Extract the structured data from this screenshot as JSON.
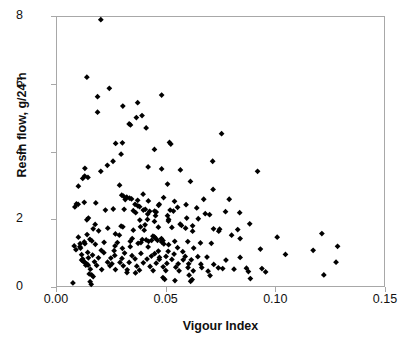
{
  "chart_data": {
    "type": "scatter",
    "title": "",
    "xlabel": "Vigour Index",
    "ylabel": "Resin flow, g/24 h",
    "xlim": [
      0.0,
      0.15
    ],
    "ylim": [
      0,
      8
    ],
    "xticks": [
      0.0,
      0.05,
      0.1,
      0.15
    ],
    "xtick_labels": [
      "0.00",
      "0.05",
      "0.10",
      "0.15"
    ],
    "yticks": [
      0,
      2,
      4,
      6,
      8
    ],
    "ytick_labels": [
      "0",
      "2",
      "4",
      "6",
      "8"
    ],
    "grid": false,
    "legend": false,
    "marker": "diamond",
    "marker_color": "#000000",
    "frame_color": "#a8a8a8",
    "series": [
      {
        "name": "Resin flow vs Vigour Index",
        "points": [
          [
            0.0201,
            7.92
          ],
          [
            0.0137,
            6.21
          ],
          [
            0.024,
            5.88
          ],
          [
            0.0186,
            5.63
          ],
          [
            0.048,
            5.68
          ],
          [
            0.037,
            5.45
          ],
          [
            0.0302,
            5.35
          ],
          [
            0.0186,
            5.17
          ],
          [
            0.039,
            5.07
          ],
          [
            0.0364,
            5.01
          ],
          [
            0.0331,
            4.82
          ],
          [
            0.0337,
            4.79
          ],
          [
            0.0409,
            4.7
          ],
          [
            0.0755,
            4.53
          ],
          [
            0.0516,
            4.27
          ],
          [
            0.03,
            4.26
          ],
          [
            0.0269,
            4.24
          ],
          [
            0.0522,
            4.22
          ],
          [
            0.0447,
            4.06
          ],
          [
            0.0294,
            3.92
          ],
          [
            0.0714,
            3.71
          ],
          [
            0.0257,
            3.71
          ],
          [
            0.0231,
            3.59
          ],
          [
            0.0418,
            3.54
          ],
          [
            0.0128,
            3.5
          ],
          [
            0.048,
            3.48
          ],
          [
            0.0566,
            3.45
          ],
          [
            0.092,
            3.41
          ],
          [
            0.0201,
            3.41
          ],
          [
            0.0127,
            3.27
          ],
          [
            0.0142,
            3.23
          ],
          [
            0.0118,
            3.2
          ],
          [
            0.0612,
            3.11
          ],
          [
            0.0507,
            3.03
          ],
          [
            0.0287,
            3.0
          ],
          [
            0.0098,
            2.97
          ],
          [
            0.0716,
            2.87
          ],
          [
            0.0395,
            2.73
          ],
          [
            0.0297,
            2.7
          ],
          [
            0.0305,
            2.67
          ],
          [
            0.032,
            2.64
          ],
          [
            0.0489,
            2.63
          ],
          [
            0.0673,
            2.58
          ],
          [
            0.079,
            2.58
          ],
          [
            0.0313,
            2.57
          ],
          [
            0.037,
            2.55
          ],
          [
            0.0419,
            2.53
          ],
          [
            0.0539,
            2.52
          ],
          [
            0.0125,
            2.49
          ],
          [
            0.0178,
            2.47
          ],
          [
            0.0089,
            2.44
          ],
          [
            0.0097,
            2.43
          ],
          [
            0.0358,
            2.43
          ],
          [
            0.0469,
            2.43
          ],
          [
            0.0592,
            2.42
          ],
          [
            0.0466,
            2.4
          ],
          [
            0.0371,
            2.38
          ],
          [
            0.0379,
            2.36
          ],
          [
            0.0553,
            2.34
          ],
          [
            0.0082,
            2.35
          ],
          [
            0.0641,
            2.32
          ],
          [
            0.0308,
            2.28
          ],
          [
            0.0405,
            2.28
          ],
          [
            0.0519,
            2.26
          ],
          [
            0.0222,
            2.26
          ],
          [
            0.035,
            2.24
          ],
          [
            0.0448,
            2.23
          ],
          [
            0.0534,
            2.23
          ],
          [
            0.0773,
            2.21
          ],
          [
            0.0838,
            2.18
          ],
          [
            0.0361,
            2.18
          ],
          [
            0.068,
            2.15
          ],
          [
            0.0416,
            2.14
          ],
          [
            0.0507,
            2.09
          ],
          [
            0.0144,
            2.02
          ],
          [
            0.0595,
            2.02
          ],
          [
            0.0648,
            2.0
          ],
          [
            0.0137,
            1.97
          ],
          [
            0.0415,
            1.98
          ],
          [
            0.038,
            1.96
          ],
          [
            0.0511,
            1.93
          ],
          [
            0.0447,
            1.92
          ],
          [
            0.0884,
            1.85
          ],
          [
            0.0565,
            1.84
          ],
          [
            0.0175,
            1.83
          ],
          [
            0.0404,
            1.82
          ],
          [
            0.0571,
            1.8
          ],
          [
            0.0622,
            1.79
          ],
          [
            0.0294,
            1.78
          ],
          [
            0.0302,
            1.76
          ],
          [
            0.0383,
            1.76
          ],
          [
            0.0465,
            1.75
          ],
          [
            0.0527,
            1.74
          ],
          [
            0.0233,
            1.72
          ],
          [
            0.059,
            1.72
          ],
          [
            0.0166,
            1.7
          ],
          [
            0.0718,
            1.7
          ],
          [
            0.0746,
            1.69
          ],
          [
            0.0829,
            1.68
          ],
          [
            0.035,
            1.66
          ],
          [
            0.04,
            1.66
          ],
          [
            0.0191,
            1.64
          ],
          [
            0.0622,
            1.63
          ],
          [
            0.1215,
            1.56
          ],
          [
            0.0138,
            1.53
          ],
          [
            0.0801,
            1.51
          ],
          [
            0.0286,
            1.51
          ],
          [
            0.044,
            1.48
          ],
          [
            0.0447,
            1.46
          ],
          [
            0.0098,
            1.45
          ],
          [
            0.101,
            1.45
          ],
          [
            0.0452,
            1.42
          ],
          [
            0.0479,
            1.41
          ],
          [
            0.0151,
            1.39
          ],
          [
            0.0391,
            1.38
          ],
          [
            0.0409,
            1.37
          ],
          [
            0.0434,
            1.36
          ],
          [
            0.0461,
            1.36
          ],
          [
            0.0486,
            1.35
          ],
          [
            0.016,
            1.34
          ],
          [
            0.0336,
            1.33
          ],
          [
            0.054,
            1.33
          ],
          [
            0.06,
            1.32
          ],
          [
            0.0125,
            1.31
          ],
          [
            0.0277,
            1.29
          ],
          [
            0.0658,
            1.28
          ],
          [
            0.0372,
            1.27
          ],
          [
            0.0708,
            1.27
          ],
          [
            0.0128,
            1.26
          ],
          [
            0.049,
            1.25
          ],
          [
            0.0176,
            1.24
          ],
          [
            0.0512,
            1.23
          ],
          [
            0.1287,
            1.18
          ],
          [
            0.0079,
            1.19
          ],
          [
            0.0336,
            1.17
          ],
          [
            0.0418,
            1.16
          ],
          [
            0.0553,
            1.14
          ],
          [
            0.0627,
            1.13
          ],
          [
            0.0933,
            1.1
          ],
          [
            0.1175,
            1.06
          ],
          [
            0.0087,
            1.08
          ],
          [
            0.0203,
            1.06
          ],
          [
            0.0262,
            1.05
          ],
          [
            0.0465,
            1.04
          ],
          [
            0.051,
            1.03
          ],
          [
            0.0577,
            1.02
          ],
          [
            0.0141,
            1.0
          ],
          [
            0.0215,
            0.99
          ],
          [
            0.031,
            0.98
          ],
          [
            0.0385,
            0.97
          ],
          [
            0.0448,
            0.96
          ],
          [
            0.0537,
            0.95
          ],
          [
            0.1048,
            0.94
          ],
          [
            0.0113,
            0.93
          ],
          [
            0.0163,
            0.92
          ],
          [
            0.0265,
            0.91
          ],
          [
            0.0344,
            0.9
          ],
          [
            0.0433,
            0.89
          ],
          [
            0.05,
            0.88
          ],
          [
            0.0588,
            0.88
          ],
          [
            0.0646,
            0.87
          ],
          [
            0.0688,
            0.86
          ],
          [
            0.084,
            0.85
          ],
          [
            0.0144,
            0.84
          ],
          [
            0.019,
            0.84
          ],
          [
            0.0247,
            0.83
          ],
          [
            0.0298,
            0.82
          ],
          [
            0.0358,
            0.81
          ],
          [
            0.0413,
            0.8
          ],
          [
            0.0469,
            0.79
          ],
          [
            0.0527,
            0.79
          ],
          [
            0.0579,
            0.78
          ],
          [
            0.0616,
            0.78
          ],
          [
            0.0775,
            0.77
          ],
          [
            0.128,
            0.71
          ],
          [
            0.0121,
            0.73
          ],
          [
            0.0172,
            0.72
          ],
          [
            0.0232,
            0.71
          ],
          [
            0.0289,
            0.7
          ],
          [
            0.0331,
            0.7
          ],
          [
            0.0396,
            0.69
          ],
          [
            0.0455,
            0.68
          ],
          [
            0.0504,
            0.67
          ],
          [
            0.0556,
            0.66
          ],
          [
            0.0604,
            0.66
          ],
          [
            0.066,
            0.65
          ],
          [
            0.0719,
            0.64
          ],
          [
            0.0132,
            0.62
          ],
          [
            0.0182,
            0.61
          ],
          [
            0.0243,
            0.6
          ],
          [
            0.0304,
            0.6
          ],
          [
            0.0366,
            0.59
          ],
          [
            0.0427,
            0.58
          ],
          [
            0.0487,
            0.57
          ],
          [
            0.0545,
            0.56
          ],
          [
            0.0601,
            0.55
          ],
          [
            0.0664,
            0.55
          ],
          [
            0.074,
            0.54
          ],
          [
            0.0869,
            0.53
          ],
          [
            0.094,
            0.52
          ],
          [
            0.0153,
            0.5
          ],
          [
            0.0205,
            0.49
          ],
          [
            0.0268,
            0.49
          ],
          [
            0.0322,
            0.48
          ],
          [
            0.0378,
            0.47
          ],
          [
            0.0441,
            0.46
          ],
          [
            0.0499,
            0.46
          ],
          [
            0.056,
            0.45
          ],
          [
            0.0625,
            0.45
          ],
          [
            0.0693,
            0.44
          ],
          [
            0.0878,
            0.43
          ],
          [
            0.0957,
            0.42
          ],
          [
            0.1224,
            0.33
          ],
          [
            0.0148,
            0.36
          ],
          [
            0.0159,
            0.33
          ],
          [
            0.0166,
            0.28
          ],
          [
            0.0321,
            0.4
          ],
          [
            0.036,
            0.39
          ],
          [
            0.0486,
            0.25
          ],
          [
            0.0494,
            0.2
          ],
          [
            0.0541,
            0.16
          ],
          [
            0.0613,
            0.14
          ],
          [
            0.062,
            0.19
          ],
          [
            0.0073,
            0.09
          ],
          [
            0.0152,
            0.13
          ],
          [
            0.0157,
            0.05
          ],
          [
            0.0887,
            0.22
          ],
          [
            0.0702,
            0.31
          ],
          [
            0.0606,
            0.32
          ],
          [
            0.076,
            0.52
          ],
          [
            0.0812,
            0.5
          ],
          [
            0.0252,
            0.66
          ],
          [
            0.0216,
            1.3
          ],
          [
            0.0108,
            1.13
          ],
          [
            0.0105,
            1.17
          ],
          [
            0.0118,
            0.8
          ],
          [
            0.0113,
            0.77
          ],
          [
            0.012,
            0.74
          ],
          [
            0.013,
            0.69
          ],
          [
            0.0136,
            0.66
          ],
          [
            0.0143,
            0.62
          ],
          [
            0.0106,
            1.26
          ],
          [
            0.0333,
            2.61
          ],
          [
            0.0342,
            2.59
          ],
          [
            0.0396,
            2.26
          ],
          [
            0.0425,
            2.22
          ],
          [
            0.0455,
            2.2
          ],
          [
            0.0258,
            2.29
          ],
          [
            0.0268,
            1.55
          ],
          [
            0.07,
            2.12
          ],
          [
            0.0742,
            1.63
          ],
          [
            0.084,
            1.41
          ],
          [
            0.0452,
            2.09
          ],
          [
            0.0512,
            1.98
          ],
          [
            0.042,
            1.33
          ],
          [
            0.048,
            1.31
          ],
          [
            0.0385,
            1.29
          ],
          [
            0.0345,
            1.41
          ],
          [
            0.047,
            0.85
          ],
          [
            0.03,
            1.12
          ],
          [
            0.0266,
            1.19
          ]
        ]
      }
    ]
  }
}
